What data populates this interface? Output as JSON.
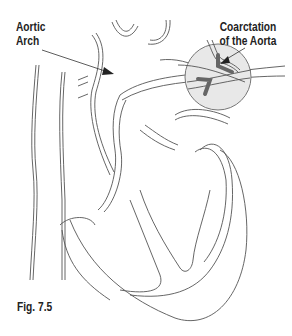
{
  "labels": {
    "aortic_arch": [
      "Aortic",
      "Arch"
    ],
    "coarctation": [
      "Coarctation",
      "of the Aorta"
    ],
    "figure": "Fig. 7.5"
  },
  "colors": {
    "line": "#555555",
    "magnifier_fill": "#e6e6e6",
    "highlight": "#666666"
  }
}
